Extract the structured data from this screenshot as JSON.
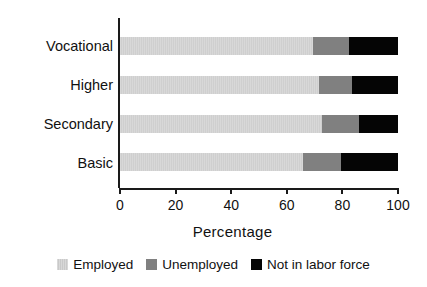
{
  "chart_data": {
    "type": "bar",
    "orientation": "horizontal",
    "stacked": true,
    "stack_total": 100,
    "title": "",
    "xlabel": "Percentage",
    "ylabel": "",
    "xlim": [
      0,
      100
    ],
    "xticks": [
      0,
      20,
      40,
      60,
      80,
      100
    ],
    "xtick_labels": [
      "0",
      "20",
      "40",
      "60",
      "80",
      "100"
    ],
    "grid": false,
    "legend_position": "bottom",
    "categories": [
      "Vocational",
      "Higher",
      "Secondary",
      "Basic"
    ],
    "series": [
      {
        "name": "Employed",
        "color": "#d5d5d5",
        "values": [
          69.5,
          71.5,
          72.5,
          66.0
        ]
      },
      {
        "name": "Unemployed",
        "color": "#808080",
        "values": [
          13.0,
          12.0,
          13.5,
          13.5
        ]
      },
      {
        "name": "Not in labor force",
        "color": "#050505",
        "values": [
          17.5,
          16.5,
          14.0,
          20.5
        ]
      }
    ]
  },
  "axis": {
    "x_title": "Percentage",
    "ticks": [
      "0",
      "20",
      "40",
      "60",
      "80",
      "100"
    ]
  },
  "categories": {
    "0": "Vocational",
    "1": "Higher",
    "2": "Secondary",
    "3": "Basic"
  },
  "legend": {
    "items": [
      {
        "label": "Employed",
        "swatch": "employed-swatch"
      },
      {
        "label": "Unemployed",
        "swatch": "unemployed-swatch"
      },
      {
        "label": "Not in labor force",
        "swatch": "not-in-labor-force-swatch"
      }
    ]
  }
}
